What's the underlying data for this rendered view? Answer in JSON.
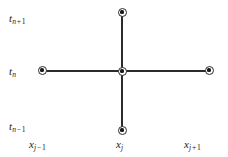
{
  "figure": {
    "type": "finite-difference-stencil",
    "background_color": "#ffffff",
    "line_color": "#2b2b2b",
    "node_color": "#1a1a1a",
    "width": 228,
    "height": 157
  },
  "time_axis_labels": {
    "upper": {
      "base": "t",
      "sub_var": "n",
      "sub_op": "+",
      "sub_num": "1",
      "text": "t n + 1"
    },
    "middle": {
      "base": "t",
      "sub_var": "n",
      "sub_op": "",
      "sub_num": "",
      "text": "t n"
    },
    "lower": {
      "base": "t",
      "sub_var": "n",
      "sub_op": "−",
      "sub_num": "1",
      "text": "t n − 1"
    }
  },
  "space_axis_labels": {
    "left": {
      "base": "x",
      "sub_var": "j",
      "sub_op": "−",
      "sub_num": "1",
      "text": "x j − 1"
    },
    "center": {
      "base": "x",
      "sub_var": "j",
      "sub_op": "",
      "sub_num": "",
      "text": "x j"
    },
    "right": {
      "base": "x",
      "sub_var": "j",
      "sub_op": "+",
      "sub_num": "1",
      "text": "x j + 1"
    }
  },
  "nodes": [
    {
      "name": "center",
      "x": 122,
      "y": 71,
      "time": "t n",
      "space": "x j"
    },
    {
      "name": "top",
      "x": 122,
      "y": 12,
      "time": "t n + 1",
      "space": "x j"
    },
    {
      "name": "bottom",
      "x": 122,
      "y": 130,
      "time": "t n − 1",
      "space": "x j"
    },
    {
      "name": "left",
      "x": 42,
      "y": 70,
      "time": "t n",
      "space": "x j − 1"
    },
    {
      "name": "right",
      "x": 209,
      "y": 70,
      "time": "t n",
      "space": "x j + 1"
    }
  ]
}
